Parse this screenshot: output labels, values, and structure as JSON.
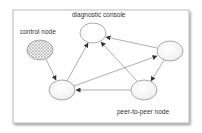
{
  "diagram": {
    "type": "network-graph",
    "labels": {
      "diagnostic_console": "diagnostic console",
      "control_node": "control node",
      "peer_to_peer_node": "peer-to-peer node"
    },
    "nodes": [
      {
        "id": "control",
        "label": "control node",
        "style": "hatched",
        "cx": 40,
        "cy": 50
      },
      {
        "id": "diagnostic",
        "label": "diagnostic console",
        "style": "plain",
        "cx": 93,
        "cy": 33
      },
      {
        "id": "right",
        "label": "",
        "style": "gradient",
        "cx": 170,
        "cy": 51
      },
      {
        "id": "peer",
        "label": "peer-to-peer node",
        "style": "gradient",
        "cx": 144,
        "cy": 90
      },
      {
        "id": "bottom_left",
        "label": "",
        "style": "gradient",
        "cx": 62,
        "cy": 90
      }
    ],
    "edges": [
      {
        "from": "control",
        "to": "bottom_left"
      },
      {
        "from": "bottom_left",
        "to": "diagnostic"
      },
      {
        "from": "bottom_left",
        "to": "right"
      },
      {
        "from": "right",
        "to": "diagnostic"
      },
      {
        "from": "right",
        "to": "peer"
      },
      {
        "from": "peer",
        "to": "bottom_left"
      },
      {
        "from": "peer",
        "to": "diagnostic"
      }
    ],
    "colors": {
      "frame_border": "#9a9a9a",
      "node_stroke": "#8a8a8a",
      "edge": "#777777",
      "node_fill": "#f2f2f2"
    }
  }
}
